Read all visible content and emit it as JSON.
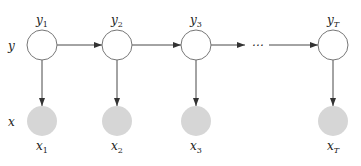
{
  "diagram": {
    "row_labels": {
      "hidden": "y",
      "observed": "x"
    },
    "nodes": [
      {
        "id": "y1",
        "label": "y",
        "sub": "1",
        "type": "hidden"
      },
      {
        "id": "y2",
        "label": "y",
        "sub": "2",
        "type": "hidden"
      },
      {
        "id": "y3",
        "label": "y",
        "sub": "3",
        "type": "hidden"
      },
      {
        "id": "yT",
        "label": "y",
        "sub": "T",
        "type": "hidden"
      },
      {
        "id": "x1",
        "label": "x",
        "sub": "1",
        "type": "observed"
      },
      {
        "id": "x2",
        "label": "x",
        "sub": "2",
        "type": "observed"
      },
      {
        "id": "x3",
        "label": "x",
        "sub": "3",
        "type": "observed"
      },
      {
        "id": "xT",
        "label": "x",
        "sub": "T",
        "type": "observed"
      }
    ],
    "ellipsis": "⋯",
    "edges": [
      [
        "y1",
        "y2"
      ],
      [
        "y2",
        "y3"
      ],
      [
        "y3",
        "ellipsis"
      ],
      [
        "ellipsis",
        "yT"
      ],
      [
        "y1",
        "x1"
      ],
      [
        "y2",
        "x2"
      ],
      [
        "y3",
        "x3"
      ],
      [
        "yT",
        "xT"
      ]
    ],
    "colors": {
      "hidden_fill": "#ffffff",
      "observed_fill": "#d6d6d6",
      "stroke": "#777777",
      "edge": "#333333"
    }
  }
}
